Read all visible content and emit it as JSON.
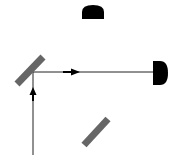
{
  "diagram": {
    "type": "optical-setup",
    "colors": {
      "background": "#ffffff",
      "mirror": "#666666",
      "detector": "#000000",
      "beam": "#222222"
    },
    "components": [
      {
        "id": "beam-splitter",
        "kind": "mirror",
        "x1": 17,
        "y1": 84,
        "x2": 43,
        "y2": 57
      },
      {
        "id": "mirror-bottom",
        "kind": "mirror",
        "x1": 84,
        "y1": 145,
        "x2": 108,
        "y2": 119
      },
      {
        "id": "detector-top",
        "kind": "detector",
        "orientation": "up",
        "x": 82,
        "y": 5,
        "w": 22,
        "h": 14
      },
      {
        "id": "detector-right",
        "kind": "detector",
        "orientation": "right",
        "x": 153,
        "y": 61,
        "w": 15,
        "h": 24
      }
    ],
    "beams": [
      {
        "id": "input-beam",
        "x1": 33,
        "y1": 155,
        "x2": 33,
        "y2": 72,
        "arrow": "up",
        "arrow_y": 92
      },
      {
        "id": "transmitted-beam",
        "x1": 33,
        "y1": 72,
        "x2": 153,
        "y2": 72,
        "arrow": "right",
        "arrow_x": 78
      }
    ]
  }
}
